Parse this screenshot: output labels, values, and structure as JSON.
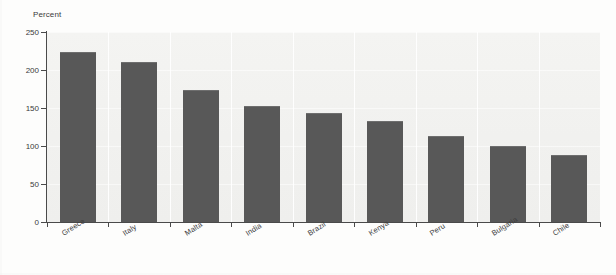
{
  "chart_data": {
    "type": "bar",
    "title": "",
    "subtitle": "",
    "xlabel": "",
    "ylabel": "Percent",
    "categories": [
      "Greece",
      "Italy",
      "Malta",
      "India",
      "Brazil",
      "Kenya",
      "Peru",
      "Bulgaria",
      "Chile"
    ],
    "values": [
      224,
      211,
      174,
      153,
      143,
      133,
      113,
      100,
      88
    ],
    "series": [
      {
        "name": "Percent",
        "values": [
          224,
          211,
          174,
          153,
          143,
          133,
          113,
          100,
          88
        ]
      }
    ],
    "ylim": [
      0,
      250
    ],
    "yticks": [
      0,
      50,
      100,
      150,
      200,
      250
    ],
    "ytick_labels": [
      "0",
      "50",
      "100",
      "150",
      "200",
      "250"
    ],
    "grid": "horizontal-faint",
    "legend": "none",
    "bar_color": "#585858",
    "plot_background": "#f2f2f0",
    "axis_color": "#4a4a4a",
    "text_color": "#3a3a3a"
  }
}
